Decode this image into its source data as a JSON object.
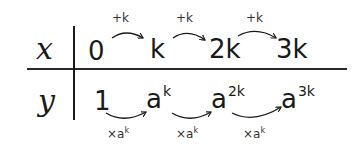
{
  "table": {
    "x_row": {
      "label": "x",
      "values": [
        "0",
        "k",
        "2k",
        "3k"
      ],
      "step_operations": [
        "+k",
        "+k",
        "+k"
      ]
    },
    "y_row": {
      "label": "y",
      "values": [
        {
          "base": "1",
          "exp": ""
        },
        {
          "base": "a",
          "exp": "k"
        },
        {
          "base": "a",
          "exp": "2k"
        },
        {
          "base": "a",
          "exp": "3k"
        }
      ],
      "step_operations": [
        {
          "prefix": "×a",
          "exp": "k"
        },
        {
          "prefix": "×a",
          "exp": "k"
        },
        {
          "prefix": "×a",
          "exp": "k"
        }
      ]
    }
  },
  "colors": {
    "ink": "#1a1a1a",
    "background": "#ffffff"
  }
}
